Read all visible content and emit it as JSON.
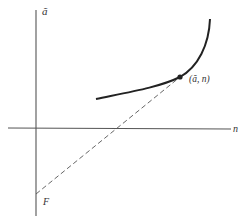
{
  "diagram": {
    "type": "economics-graph",
    "y_axis": {
      "label": "ã"
    },
    "x_axis": {
      "label": "n"
    },
    "curve": {
      "description": "upward-sloping convex curve"
    },
    "point": {
      "label": "(ã, n)"
    },
    "intercept": {
      "label": "F"
    },
    "tangent_line": {
      "style": "dashed",
      "description": "line from F through the tangency point"
    },
    "colors": {
      "ink": "#333333",
      "axis": "#555555",
      "background": "#ffffff"
    }
  }
}
